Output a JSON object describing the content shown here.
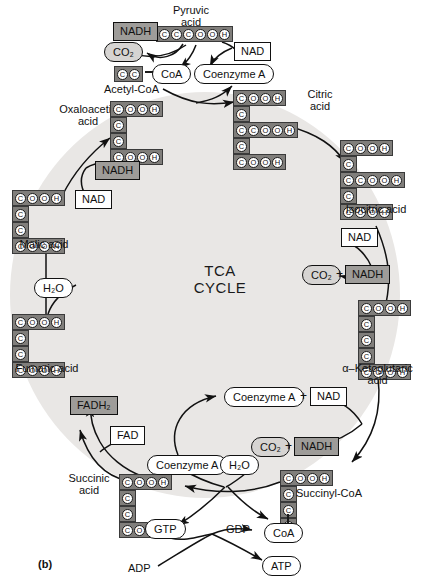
{
  "figure": {
    "panel_label": "(b)",
    "center_title_line1": "TCA",
    "center_title_line2": "CYCLE"
  },
  "colors": {
    "cycle_fill": "#e9e7e5",
    "chain_box_fill": "#807e7b",
    "nadh_box_fill": "#9e9c99",
    "co2_pill_fill": "#d6d4d2",
    "stroke": "#111111",
    "page_bg": "#ffffff"
  },
  "metabolites": [
    {
      "id": "pyruvic-acid",
      "label": "Pyruvic\nacid",
      "label_line1": "Pyruvic",
      "label_line2": "acid",
      "carbons": 3,
      "structure": [
        [
          "C",
          "C",
          "C",
          "O",
          "O",
          "H"
        ]
      ]
    },
    {
      "id": "acetyl-coa",
      "label": "Acetyl-CoA",
      "carbons": 2,
      "structure": [
        [
          "C",
          "C"
        ]
      ],
      "bound_group": "CoA"
    },
    {
      "id": "oxaloacetic-acid",
      "label_line1": "Oxaloacetic",
      "label_line2": "acid",
      "label": "Oxaloacetic acid",
      "carbons": 4,
      "structure": [
        [
          "C",
          "O",
          "O",
          "H"
        ],
        [
          "C"
        ],
        [
          "C"
        ],
        [
          "C",
          "O",
          "O",
          "H"
        ]
      ]
    },
    {
      "id": "citric-acid",
      "label_line1": "Citric",
      "label_line2": "acid",
      "label": "Citric acid",
      "carbons": 6,
      "structure": [
        [
          "C",
          "O",
          "O",
          "H"
        ],
        [
          "C"
        ],
        [
          "C",
          "C",
          "O",
          "O",
          "H"
        ],
        [
          "C"
        ],
        [
          "C",
          "O",
          "O",
          "H"
        ]
      ]
    },
    {
      "id": "isocitric-acid",
      "label": "Isocitric acid",
      "carbons": 6,
      "structure": [
        [
          "C",
          "O",
          "O",
          "H"
        ],
        [
          "C"
        ],
        [
          "C",
          "C",
          "O",
          "O",
          "H"
        ],
        [
          "C"
        ],
        [
          "C",
          "O",
          "O",
          "H"
        ]
      ]
    },
    {
      "id": "alpha-ketoglutaric-acid",
      "label_line1": "α–Ketoglutaric",
      "label_line2": "acid",
      "label": "α–Ketoglutaric acid",
      "carbons": 5,
      "structure": [
        [
          "C",
          "O",
          "O",
          "H"
        ],
        [
          "C"
        ],
        [
          "C"
        ],
        [
          "C"
        ],
        [
          "C",
          "O",
          "O",
          "H"
        ]
      ]
    },
    {
      "id": "succinyl-coa",
      "label": "Succinyl-CoA",
      "carbons": 4,
      "structure": [
        [
          "C",
          "O",
          "O",
          "H"
        ],
        [
          "C"
        ],
        [
          "C"
        ],
        [
          "C"
        ]
      ],
      "bound_group": "CoA"
    },
    {
      "id": "succinic-acid",
      "label_line1": "Succinic",
      "label_line2": "acid",
      "label": "Succinic acid",
      "carbons": 4,
      "structure": [
        [
          "C",
          "O",
          "O",
          "H"
        ],
        [
          "C"
        ],
        [
          "C"
        ],
        [
          "C",
          "O",
          "O",
          "H"
        ]
      ]
    },
    {
      "id": "fumaric-acid",
      "label": "Fumaric acid",
      "carbons": 4,
      "structure": [
        [
          "C",
          "O",
          "O",
          "H"
        ],
        [
          "C"
        ],
        [
          "C"
        ],
        [
          "C",
          "O",
          "O",
          "H"
        ]
      ]
    },
    {
      "id": "malic-acid",
      "label": "Malic acid",
      "carbons": 4,
      "structure": [
        [
          "C",
          "O",
          "O",
          "H"
        ],
        [
          "C"
        ],
        [
          "C"
        ],
        [
          "C",
          "O",
          "O",
          "H"
        ]
      ]
    }
  ],
  "cofactors": {
    "nad_top": "NAD",
    "nad_oxaloacetate": "NAD",
    "nad_isocitrate": "NAD",
    "nad_ketoglutarate": "NAD",
    "nadh_pyruvate": "NADH",
    "nadh_malate": "NADH",
    "nadh_isocitrate": "NADH",
    "nadh_ketoglutarate": "NADH",
    "fad": "FAD",
    "fadh2": "FADH₂",
    "co2_pyruvate": "CO₂",
    "co2_isocitrate": "CO₂",
    "co2_ketoglutarate": "CO₂",
    "coa_acetyl": "CoA",
    "coa_succinyl": "CoA",
    "coenzyme_a_top": "Coenzyme A",
    "coenzyme_a_ketoglutarate": "Coenzyme A",
    "coenzyme_a_succinyl": "Coenzyme A",
    "water_fumarate": "H₂O",
    "water_succinyl": "H₂O",
    "plus_isocitrate": "+",
    "plus_ketoglutarate": "+",
    "plus_coenzyme_nad": "+"
  },
  "energy": {
    "gtp": "GTP",
    "gdp": "GDP",
    "adp": "ADP",
    "atp": "ATP"
  }
}
